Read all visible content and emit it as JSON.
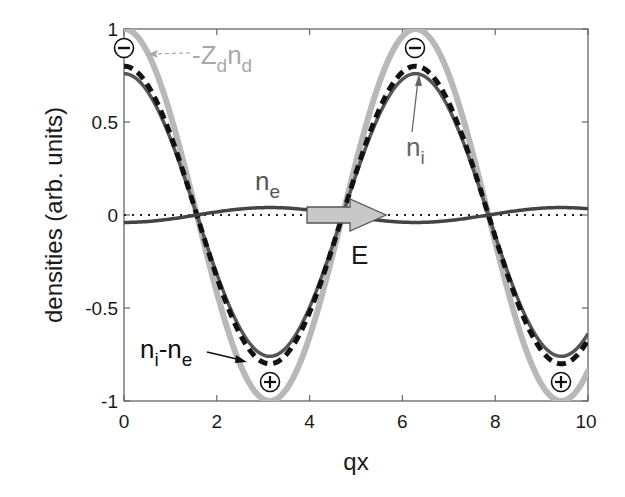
{
  "chart_data": {
    "type": "line",
    "title": "",
    "xlabel": "qx",
    "ylabel": "densities (arb. units)",
    "xlim": [
      0,
      10
    ],
    "ylim": [
      -1,
      1
    ],
    "xticks": [
      "0",
      "2",
      "4",
      "6",
      "8",
      "10"
    ],
    "yticks": [
      "-1",
      "-0.5",
      "0",
      "0.5",
      "1"
    ],
    "grid": false,
    "legend": "none (inline annotations)",
    "series": [
      {
        "name": "-Z_d n_d",
        "style": "thick light-gray solid",
        "color": "#b8b8b8",
        "function": "cos(x)",
        "amplitude": 1.0,
        "x": [
          0,
          1.57,
          3.14,
          4.71,
          6.28,
          7.85,
          9.42,
          10
        ],
        "values": [
          1.0,
          0.0,
          -1.0,
          0.0,
          1.0,
          0.0,
          -1.0,
          -0.84
        ]
      },
      {
        "name": "n_i",
        "style": "dark-gray solid",
        "color": "#555555",
        "function": "0.76*cos(x)",
        "amplitude": 0.76,
        "x": [
          0,
          1.57,
          3.14,
          4.71,
          6.28,
          7.85,
          9.42,
          10
        ],
        "values": [
          0.76,
          0.0,
          -0.76,
          0.0,
          0.76,
          0.0,
          -0.76,
          -0.64
        ]
      },
      {
        "name": "n_i - n_e",
        "style": "black thick dashed",
        "color": "#111111",
        "function": "0.80*cos(x)",
        "amplitude": 0.8,
        "x": [
          0,
          1.57,
          3.14,
          4.71,
          6.28,
          7.85,
          9.42,
          10
        ],
        "values": [
          0.8,
          0.0,
          -0.8,
          0.0,
          0.8,
          0.0,
          -0.8,
          -0.67
        ]
      },
      {
        "name": "n_e",
        "style": "dark-gray solid",
        "color": "#444444",
        "function": "-0.04*cos(x)",
        "amplitude": 0.04,
        "x": [
          0,
          1.57,
          3.14,
          4.71,
          6.28,
          7.85,
          9.42,
          10
        ],
        "values": [
          -0.04,
          0.0,
          0.04,
          0.0,
          -0.04,
          0.0,
          0.04,
          0.034
        ]
      },
      {
        "name": "zero line",
        "style": "black dotted",
        "color": "#222222",
        "x": [
          0,
          10
        ],
        "values": [
          0,
          0
        ]
      }
    ],
    "annotations": [
      {
        "text": "-Z_d n_d",
        "x": 1.4,
        "y": 0.88,
        "arrow_to": [
          0.4,
          0.9
        ]
      },
      {
        "text": "n_i",
        "x": 6.0,
        "y": 0.42,
        "arrow_to": [
          6.25,
          0.76
        ]
      },
      {
        "text": "n_e",
        "x": 3.7,
        "y": 0.1
      },
      {
        "text": "n_i-n_e",
        "x": 1.0,
        "y": -0.82,
        "arrow_to": [
          2.8,
          -0.85
        ]
      },
      {
        "text": "E",
        "x": 5.2,
        "y": -0.2,
        "type": "field arrow",
        "from": [
          4.5,
          0
        ],
        "to": [
          6.0,
          0
        ]
      },
      {
        "text": "⊖",
        "x": 0,
        "y": 0.9
      },
      {
        "text": "⊖",
        "x": 6.28,
        "y": 0.9
      },
      {
        "text": "⊕",
        "x": 3.14,
        "y": -0.9
      },
      {
        "text": "⊕",
        "x": 9.42,
        "y": -0.9
      }
    ]
  },
  "labels": {
    "xlabel": "qx",
    "ylabel": "densities (arb. units)",
    "xticks": [
      "0",
      "2",
      "4",
      "6",
      "8",
      "10"
    ],
    "yticks": [
      "1",
      "0.5",
      "0",
      "-0.5",
      "-1"
    ],
    "anno_zd_main": "-Z",
    "anno_zd_sub1": "d",
    "anno_zd_n": "n",
    "anno_zd_sub2": "d",
    "anno_ni_main": "n",
    "anno_ni_sub": "i",
    "anno_ne_main": "n",
    "anno_ne_sub": "e",
    "anno_diff_n1": "n",
    "anno_diff_sub1": "i",
    "anno_diff_mid": "-n",
    "anno_diff_sub2": "e",
    "anno_E": "E"
  },
  "colors": {
    "zd": "#b8b8b8",
    "ni": "#555555",
    "diff": "#111111",
    "ne": "#444444",
    "arrow_fill": "#c8c8c8",
    "axes": "#555555",
    "anno_gray": "#9a9a9a"
  }
}
